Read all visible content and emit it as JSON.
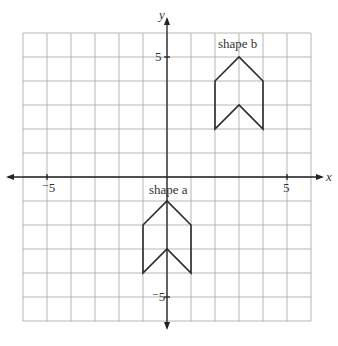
{
  "diagram": {
    "type": "coordinate-grid",
    "x_axis_label": "x",
    "y_axis_label": "y",
    "x_range": [
      -6,
      6
    ],
    "y_range": [
      -6,
      6
    ],
    "grid_step": 1,
    "tick_labels": {
      "x_neg": "⁻5",
      "x_pos": "5",
      "y_pos": "5",
      "y_neg": "⁻5"
    },
    "shapes": [
      {
        "label": "shape b",
        "vertices": [
          [
            2,
            4
          ],
          [
            3,
            5
          ],
          [
            4,
            4
          ],
          [
            4,
            2
          ],
          [
            3,
            3
          ],
          [
            2,
            2
          ]
        ]
      },
      {
        "label": "shape a",
        "vertices": [
          [
            -1,
            -2
          ],
          [
            0,
            -1
          ],
          [
            1,
            -2
          ],
          [
            1,
            -4
          ],
          [
            0,
            -3
          ],
          [
            -1,
            -4
          ]
        ]
      }
    ],
    "colors": {
      "grid": "#b5b5b5",
      "axis": "#222222",
      "shape": "#2a2a2a"
    }
  }
}
